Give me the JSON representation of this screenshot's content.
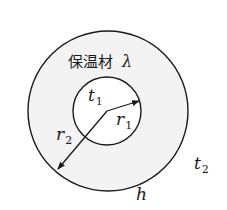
{
  "diagram": {
    "type": "cross-section of insulated cylinder",
    "colors": {
      "stroke": "#1a1a1a",
      "insulation_fill": "#f2f2f2",
      "inner_fill": "#ffffff",
      "background": "#ffffff"
    },
    "labels": {
      "insulation_material": "保温材",
      "conductivity_symbol": "λ",
      "inner_temp": {
        "base": "t",
        "sub": "1"
      },
      "inner_radius": {
        "base": "r",
        "sub": "1"
      },
      "outer_radius": {
        "base": "r",
        "sub": "2"
      },
      "ambient_temp": {
        "base": "t",
        "sub": "2"
      },
      "heat_transfer_coeff": "h"
    }
  }
}
